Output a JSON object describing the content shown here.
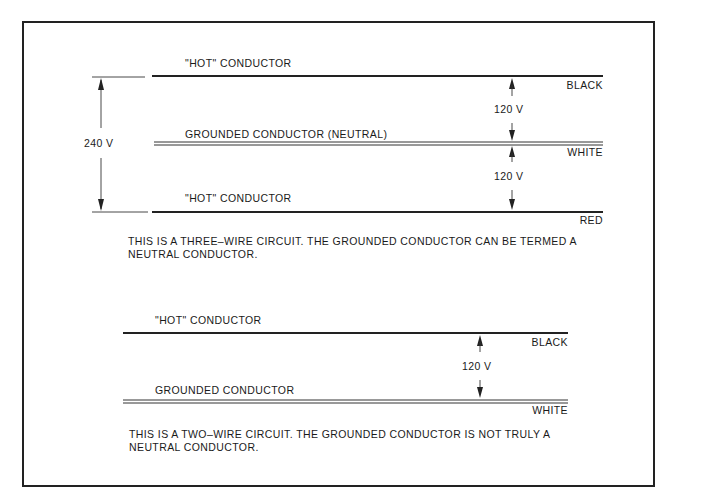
{
  "figure": {
    "three_wire": {
      "dimension_total": "240 V",
      "conductors": [
        {
          "label": "\"HOT\" CONDUCTOR",
          "color_label": "BLACK",
          "line_style": "thick"
        },
        {
          "label": "GROUNDED CONDUCTOR (NEUTRAL)",
          "color_label": "WHITE",
          "line_style": "double"
        },
        {
          "label": "\"HOT\" CONDUCTOR",
          "color_label": "RED",
          "line_style": "thick"
        }
      ],
      "voltages": [
        "120 V",
        "120 V"
      ],
      "caption_line1": "THIS IS A THREE–WIRE CIRCUIT. THE GROUNDED CONDUCTOR CAN BE TERMED A",
      "caption_line2": "NEUTRAL CONDUCTOR."
    },
    "two_wire": {
      "conductors": [
        {
          "label": "\"HOT\" CONDUCTOR",
          "color_label": "BLACK",
          "line_style": "thick"
        },
        {
          "label": "GROUNDED CONDUCTOR",
          "color_label": "WHITE",
          "line_style": "double"
        }
      ],
      "voltages": [
        "120 V"
      ],
      "caption_line1": "THIS IS A TWO–WIRE CIRCUIT. THE GROUNDED CONDUCTOR IS NOT TRULY A",
      "caption_line2": "NEUTRAL CONDUCTOR."
    }
  }
}
